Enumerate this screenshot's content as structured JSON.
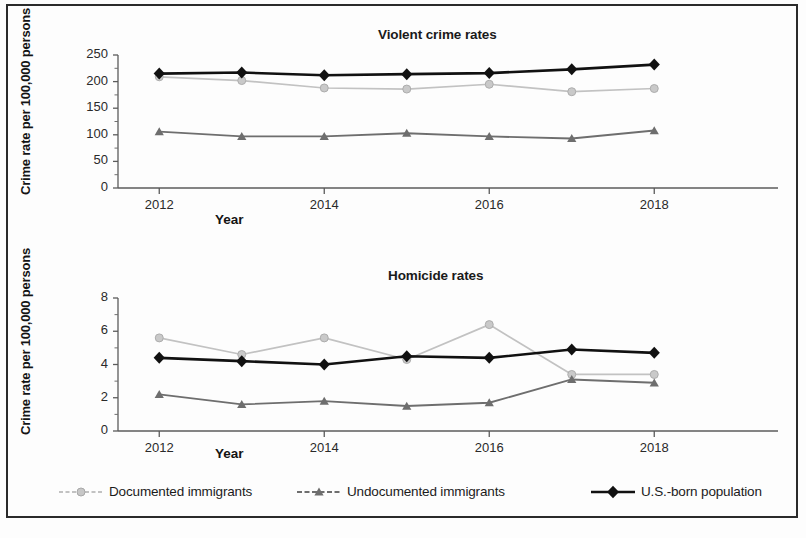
{
  "figure": {
    "border_color": "#2b2b2b",
    "background": "#ffffff"
  },
  "series_styles": {
    "documented": {
      "color": "#c2c2c2",
      "marker": "circle"
    },
    "undocumented": {
      "color": "#6e6e6e",
      "marker": "triangle"
    },
    "usborn": {
      "color": "#111111",
      "marker": "diamond"
    }
  },
  "legend": {
    "items": [
      {
        "key": "documented",
        "label": "Documented immigrants"
      },
      {
        "key": "undocumented",
        "label": "Undocumented immigrants"
      },
      {
        "key": "usborn",
        "label": "U.S.-born population"
      }
    ]
  },
  "chart_data": [
    {
      "type": "line",
      "title": "Violent crime rates",
      "xlabel": "Year",
      "ylabel": "Crime rate per 100,000 persons",
      "x": [
        2012,
        2013,
        2014,
        2015,
        2016,
        2017,
        2018
      ],
      "xlim": [
        2011.5,
        2019.5
      ],
      "xticks": [
        2012,
        2014,
        2016,
        2018
      ],
      "xticklabels": [
        "2012",
        "2014",
        "2016",
        "2018"
      ],
      "ylim": [
        0,
        250
      ],
      "yticks": [
        0,
        50,
        100,
        150,
        200,
        250
      ],
      "yticklabels": [
        "0",
        "50",
        "100",
        "150",
        "200",
        "250"
      ],
      "grid": false,
      "legend_position": "below-figure",
      "series": [
        {
          "name": "Documented immigrants",
          "key": "documented",
          "values": [
            209,
            202,
            188,
            186,
            195,
            181,
            187
          ]
        },
        {
          "name": "Undocumented immigrants",
          "key": "undocumented",
          "values": [
            106,
            97,
            97,
            103,
            97,
            93,
            108
          ]
        },
        {
          "name": "U.S.-born population",
          "key": "usborn",
          "values": [
            215,
            217,
            212,
            214,
            216,
            223,
            232
          ]
        }
      ]
    },
    {
      "type": "line",
      "title": "Homicide rates",
      "xlabel": "Year",
      "ylabel": "Crime rate per 100,000 persons",
      "x": [
        2012,
        2013,
        2014,
        2015,
        2016,
        2017,
        2018
      ],
      "xlim": [
        2011.5,
        2019.5
      ],
      "xticks": [
        2012,
        2014,
        2016,
        2018
      ],
      "xticklabels": [
        "2012",
        "2014",
        "2016",
        "2018"
      ],
      "ylim": [
        0,
        8
      ],
      "yticks": [
        0,
        2,
        4,
        6,
        8
      ],
      "yticklabels": [
        "0",
        "2",
        "4",
        "6",
        "8"
      ],
      "grid": false,
      "legend_position": "below-figure",
      "series": [
        {
          "name": "Documented immigrants",
          "key": "documented",
          "values": [
            5.6,
            4.6,
            5.6,
            4.3,
            6.4,
            3.4,
            3.4
          ]
        },
        {
          "name": "Undocumented immigrants",
          "key": "undocumented",
          "values": [
            2.2,
            1.6,
            1.8,
            1.5,
            1.7,
            3.1,
            2.9
          ]
        },
        {
          "name": "U.S.-born population",
          "key": "usborn",
          "values": [
            4.4,
            4.2,
            4.0,
            4.5,
            4.4,
            4.9,
            4.7
          ]
        }
      ]
    }
  ]
}
